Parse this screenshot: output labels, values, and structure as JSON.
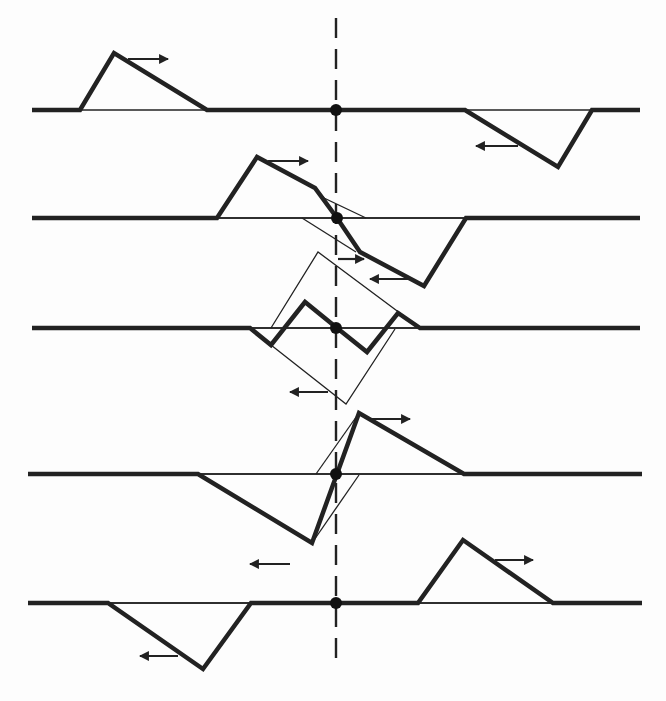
{
  "figure": {
    "title": "",
    "symmetry_axis": {
      "x": 336,
      "y1": 18,
      "y2": 668,
      "style": "dashed"
    },
    "colors": {
      "ink": "#222222",
      "background": "#fdfdfd"
    }
  },
  "frames": [
    {
      "id": "frame-1",
      "baseline_y": 110,
      "string_x": [
        32,
        640
      ],
      "center_dot": [
        336,
        110
      ],
      "thick_path": [
        [
          32,
          110
        ],
        [
          80,
          110
        ],
        [
          114,
          53
        ],
        [
          207,
          110
        ],
        [
          465,
          110
        ],
        [
          558,
          167
        ],
        [
          592,
          110
        ],
        [
          640,
          110
        ]
      ],
      "thin_paths": [],
      "arrows": [
        {
          "direction": "right",
          "from": [
            128,
            59
          ],
          "to": [
            168,
            59
          ]
        },
        {
          "direction": "left",
          "from": [
            518,
            146
          ],
          "to": [
            476,
            146
          ]
        }
      ]
    },
    {
      "id": "frame-2",
      "baseline_y": 218,
      "string_x": [
        32,
        640
      ],
      "center_dot": [
        337,
        218
      ],
      "thick_path": [
        [
          32,
          218
        ],
        [
          217,
          218
        ],
        [
          257,
          157
        ],
        [
          315,
          188
        ],
        [
          337,
          218
        ],
        [
          360,
          252
        ],
        [
          424,
          286
        ],
        [
          466,
          218
        ],
        [
          640,
          218
        ]
      ],
      "thin_paths": [
        [
          [
            217,
            218
          ],
          [
            466,
            218
          ]
        ],
        [
          [
            315,
            188
          ],
          [
            324,
            198
          ],
          [
            366,
            218
          ]
        ],
        [
          [
            302,
            218
          ],
          [
            356,
            252
          ]
        ]
      ],
      "arrows": [
        {
          "direction": "right",
          "from": [
            268,
            161
          ],
          "to": [
            308,
            161
          ]
        },
        {
          "direction": "right",
          "from": [
            338,
            259
          ],
          "to": [
            364,
            259
          ]
        },
        {
          "direction": "left",
          "from": [
            410,
            279
          ],
          "to": [
            370,
            279
          ]
        }
      ]
    },
    {
      "id": "frame-3",
      "baseline_y": 328,
      "string_x": [
        32,
        640
      ],
      "center_dot": [
        336,
        328
      ],
      "thick_path": [
        [
          32,
          328
        ],
        [
          250,
          328
        ],
        [
          271,
          345
        ],
        [
          305,
          302
        ],
        [
          337,
          328
        ],
        [
          367,
          352
        ],
        [
          398,
          313
        ],
        [
          420,
          328
        ],
        [
          640,
          328
        ]
      ],
      "thin_paths": [
        [
          [
            250,
            328
          ],
          [
            420,
            328
          ]
        ],
        [
          [
            271,
            328
          ],
          [
            318,
            252
          ],
          [
            420,
            328
          ]
        ],
        [
          [
            271,
            345
          ],
          [
            346,
            404
          ],
          [
            395,
            329
          ]
        ]
      ],
      "arrows": [
        {
          "direction": "left",
          "from": [
            328,
            392
          ],
          "to": [
            290,
            392
          ]
        }
      ]
    },
    {
      "id": "frame-4",
      "baseline_y": 474,
      "string_x": [
        28,
        642
      ],
      "center_dot": [
        336,
        474
      ],
      "thick_path": [
        [
          28,
          474
        ],
        [
          198,
          474
        ],
        [
          312,
          543
        ],
        [
          359,
          413
        ],
        [
          464,
          474
        ],
        [
          642,
          474
        ]
      ],
      "thin_paths": [
        [
          [
            198,
            474
          ],
          [
            464,
            474
          ]
        ],
        [
          [
            316,
            474
          ],
          [
            359,
            413
          ]
        ],
        [
          [
            312,
            543
          ],
          [
            359,
            475
          ]
        ]
      ],
      "arrows": [
        {
          "direction": "right",
          "from": [
            370,
            419
          ],
          "to": [
            410,
            419
          ]
        },
        {
          "direction": "left",
          "from": [
            290,
            564
          ],
          "to": [
            250,
            564
          ]
        }
      ]
    },
    {
      "id": "frame-5",
      "baseline_y": 603,
      "string_x": [
        28,
        642
      ],
      "center_dot": [
        336,
        603
      ],
      "thick_path": [
        [
          28,
          603
        ],
        [
          108,
          603
        ],
        [
          203,
          669
        ],
        [
          251,
          603
        ],
        [
          418,
          603
        ],
        [
          463,
          540
        ],
        [
          553,
          603
        ],
        [
          642,
          603
        ]
      ],
      "thin_paths": [
        [
          [
            108,
            603
          ],
          [
            251,
            603
          ]
        ],
        [
          [
            418,
            603
          ],
          [
            553,
            603
          ]
        ]
      ],
      "arrows": [
        {
          "direction": "left",
          "from": [
            178,
            656
          ],
          "to": [
            140,
            656
          ]
        },
        {
          "direction": "right",
          "from": [
            495,
            560
          ],
          "to": [
            533,
            560
          ]
        }
      ]
    }
  ]
}
